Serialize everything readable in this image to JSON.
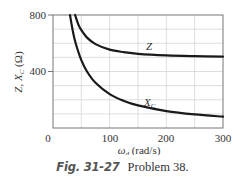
{
  "chart_data": {
    "type": "line",
    "title": "",
    "xlabel": "ω_d (rad/s)",
    "ylabel": "Z, X_C (Ω)",
    "xlim": [
      0,
      300
    ],
    "ylim": [
      0,
      800
    ],
    "x_ticks": [
      0,
      100,
      200,
      300
    ],
    "y_ticks": [
      400,
      800
    ],
    "grid": true,
    "grid_x_step": 50,
    "grid_y_step": 100,
    "legend": "inline labels on curves",
    "series": [
      {
        "name": "Z",
        "x": [
          39,
          45,
          50,
          60,
          75,
          100,
          125,
          150,
          200,
          250,
          300
        ],
        "values": [
          800,
          730,
          693,
          640,
          594,
          555,
          537,
          525,
          514,
          509,
          506
        ]
      },
      {
        "name": "X_C",
        "x": [
          30,
          35,
          40,
          50,
          60,
          75,
          100,
          125,
          150,
          200,
          250,
          300
        ],
        "values": [
          800,
          686,
          600,
          480,
          400,
          320,
          240,
          192,
          160,
          120,
          96,
          80
        ]
      }
    ],
    "annotations": [
      {
        "text": "Z",
        "x": 170,
        "y": 540
      },
      {
        "text": "X_C",
        "x": 168,
        "y": 150
      }
    ]
  },
  "axes": {
    "x_tick_labels": [
      "0",
      "100",
      "200",
      "300"
    ],
    "y_tick_labels": [
      "400",
      "800"
    ],
    "xlabel_main": "ω",
    "xlabel_sub": "d",
    "xlabel_unit": " (rad/s)",
    "ylabel_main": "Z, X",
    "ylabel_sub": "C",
    "ylabel_unit": " (Ω)"
  },
  "labels": {
    "z": "Z",
    "xc_main": "X",
    "xc_sub": "C"
  },
  "caption": {
    "figure": "Fig. 31-27",
    "text": "Problem 38."
  },
  "colors": {
    "curve": "#1a1a1a",
    "grid": "#d6d6d6",
    "axis": "#777777"
  }
}
